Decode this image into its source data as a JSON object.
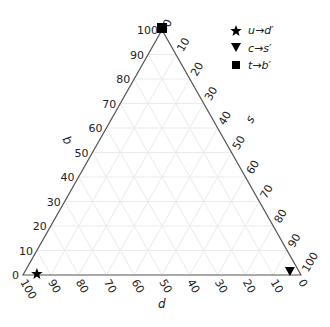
{
  "chart_data": {
    "type": "scatter",
    "subtype": "ternary",
    "title": "",
    "axes": {
      "b": {
        "label": "b",
        "side": "left",
        "ticks": [
          "0",
          "10",
          "20",
          "30",
          "40",
          "50",
          "60",
          "70",
          "80",
          "90",
          "100"
        ],
        "range": [
          0,
          100
        ]
      },
      "s": {
        "label": "s",
        "side": "right",
        "ticks": [
          "0",
          "10",
          "20",
          "30",
          "40",
          "50",
          "60",
          "70",
          "80",
          "90",
          "100"
        ],
        "range": [
          0,
          100
        ]
      },
      "d": {
        "label": "d",
        "side": "bottom",
        "ticks": [
          "100",
          "90",
          "80",
          "70",
          "60",
          "50",
          "40",
          "30",
          "20",
          "10",
          "0"
        ],
        "range": [
          100,
          0
        ]
      }
    },
    "grid": true,
    "grid_step": 10,
    "legend_position": "top-right",
    "series": [
      {
        "name": "u→d′",
        "marker": "star",
        "points": [
          {
            "d": 95,
            "s": 5,
            "b": 0
          }
        ]
      },
      {
        "name": "c→s′",
        "marker": "triangle-down",
        "points": [
          {
            "d": 4,
            "s": 96,
            "b": 0
          }
        ]
      },
      {
        "name": "t→b′",
        "marker": "square",
        "points": [
          {
            "d": 0,
            "s": 0,
            "b": 100
          }
        ]
      }
    ]
  },
  "legend": {
    "items": [
      {
        "label": "u→d′",
        "icon": "star-icon"
      },
      {
        "label": "c→s′",
        "icon": "triangle-down-icon"
      },
      {
        "label": "t→b′",
        "icon": "square-icon"
      }
    ]
  },
  "labels": {
    "b": "b",
    "s": "s",
    "d": "d"
  },
  "colors": {
    "axis": "#555555",
    "grid": "#ebebeb",
    "marker": "#000000",
    "text": "#222222"
  }
}
